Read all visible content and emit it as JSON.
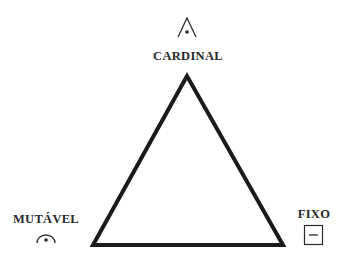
{
  "diagram": {
    "type": "triangle-of-modalities",
    "stroke_color": "#1a1a1a",
    "text_color": "#2a2a2a",
    "vertices": {
      "top": {
        "label": "CARDINAL",
        "icon": "cardinal-symbol-icon"
      },
      "bottom_left": {
        "label": "MUTÁVEL",
        "icon": "mutable-symbol-icon"
      },
      "bottom_right": {
        "label": "FIXO",
        "icon": "fixed-symbol-icon"
      }
    }
  }
}
